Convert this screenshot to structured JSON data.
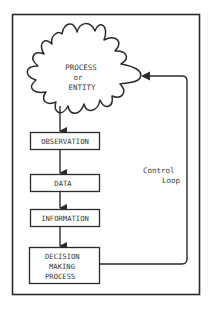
{
  "diagram": {
    "type": "control-loop-flowchart",
    "colors": {
      "stroke": "#2b2b2b",
      "text": "#3a3a3a",
      "background": "#ffffff"
    },
    "cloud": {
      "line1": "PROCESS",
      "line2": "or",
      "line3": "ENTITY"
    },
    "boxes": [
      {
        "id": "observation",
        "lines": [
          "OBSERVATION"
        ]
      },
      {
        "id": "data",
        "lines": [
          "DATA"
        ]
      },
      {
        "id": "information",
        "lines": [
          "INFORMATION"
        ]
      },
      {
        "id": "decision",
        "lines": [
          "DECISION",
          "MAKING",
          "PROCESS"
        ]
      }
    ],
    "loop_label": {
      "line1": "Control",
      "line2": "Loop"
    }
  }
}
